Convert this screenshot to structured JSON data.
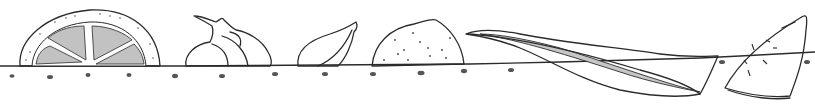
{
  "illustration": {
    "style": "hand-drawn ink and grey wash",
    "colors": {
      "background": "#ffffff",
      "ink": "#2b2b2b",
      "light_wash": "#d9d9d9",
      "mid_wash": "#a9a9a9",
      "dark_wash": "#8a8a8a"
    },
    "items": [
      {
        "name": "citrus-half-slice",
        "x": 20
      },
      {
        "name": "garlic-bulb",
        "x": 185
      },
      {
        "name": "shallot",
        "x": 297
      },
      {
        "name": "lime",
        "x": 372
      },
      {
        "name": "bay-leaf",
        "x": 465
      },
      {
        "name": "melon-wedge",
        "x": 725
      }
    ],
    "ground_line_y": 66,
    "dots_y": 76
  }
}
